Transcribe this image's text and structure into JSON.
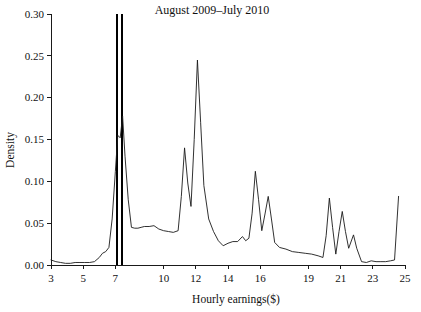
{
  "chart_data": {
    "type": "line",
    "title": "August 2009–July 2010",
    "xlabel": "Hourly earnings($)",
    "ylabel": "Density",
    "xlim": [
      3,
      25
    ],
    "ylim": [
      0.0,
      0.3
    ],
    "grid": false,
    "legend": null,
    "xticks": [
      3,
      5,
      7,
      10,
      12,
      14,
      16,
      19,
      21,
      23,
      25
    ],
    "xtick_labels": [
      "3",
      "5",
      "7",
      "10",
      "12",
      "14",
      "16",
      "19",
      "21",
      "23",
      "25"
    ],
    "yticks": [
      0.0,
      0.05,
      0.1,
      0.15,
      0.2,
      0.25,
      0.3
    ],
    "ytick_labels": [
      "0.00",
      "0.05",
      "0.10",
      "0.15",
      "0.20",
      "0.25",
      "0.30"
    ],
    "series": [
      {
        "name": "Density",
        "x": [
          3.0,
          3.3,
          3.6,
          3.9,
          4.2,
          4.5,
          4.8,
          5.1,
          5.4,
          5.7,
          6.0,
          6.2,
          6.4,
          6.6,
          6.8,
          7.0,
          7.15,
          7.3,
          7.45,
          7.6,
          7.8,
          8.0,
          8.2,
          8.4,
          8.6,
          8.8,
          9.1,
          9.4,
          9.7,
          10.0,
          10.3,
          10.6,
          10.9,
          11.1,
          11.3,
          11.5,
          11.7,
          11.9,
          12.1,
          12.3,
          12.5,
          12.8,
          13.1,
          13.4,
          13.7,
          14.0,
          14.3,
          14.6,
          14.9,
          15.1,
          15.3,
          15.5,
          15.7,
          15.9,
          16.1,
          16.3,
          16.5,
          16.7,
          16.9,
          17.2,
          17.6,
          18.0,
          18.4,
          18.8,
          19.2,
          19.6,
          19.9,
          20.1,
          20.3,
          20.5,
          20.7,
          20.9,
          21.1,
          21.3,
          21.5,
          21.8,
          22.0,
          22.3,
          22.6,
          22.9,
          23.2,
          23.5,
          23.8,
          24.1,
          24.35,
          24.6
        ],
        "y": [
          0.006,
          0.004,
          0.003,
          0.002,
          0.002,
          0.003,
          0.003,
          0.003,
          0.003,
          0.004,
          0.009,
          0.014,
          0.016,
          0.021,
          0.055,
          0.112,
          0.155,
          0.152,
          0.178,
          0.13,
          0.078,
          0.045,
          0.044,
          0.044,
          0.045,
          0.046,
          0.046,
          0.047,
          0.043,
          0.041,
          0.04,
          0.039,
          0.041,
          0.082,
          0.14,
          0.098,
          0.07,
          0.15,
          0.245,
          0.17,
          0.095,
          0.055,
          0.04,
          0.029,
          0.023,
          0.026,
          0.028,
          0.028,
          0.034,
          0.029,
          0.032,
          0.062,
          0.112,
          0.078,
          0.041,
          0.061,
          0.082,
          0.055,
          0.027,
          0.021,
          0.019,
          0.016,
          0.015,
          0.014,
          0.013,
          0.011,
          0.009,
          0.035,
          0.08,
          0.045,
          0.013,
          0.04,
          0.064,
          0.04,
          0.02,
          0.036,
          0.02,
          0.004,
          0.003,
          0.005,
          0.004,
          0.004,
          0.004,
          0.005,
          0.006,
          0.082
        ]
      }
    ],
    "reference_lines": [
      {
        "name": "minimum-wage-line-1",
        "x": 7.12,
        "y_top": 0.3
      },
      {
        "name": "minimum-wage-line-2",
        "x": 7.42,
        "y_top": 0.3
      }
    ]
  }
}
